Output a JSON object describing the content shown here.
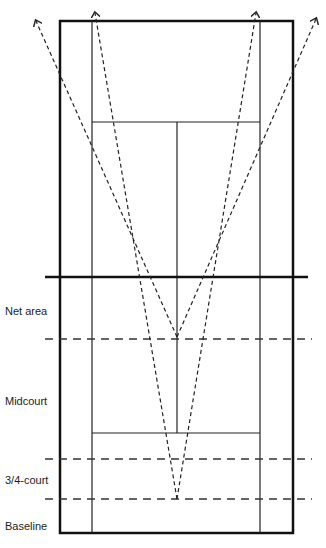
{
  "diagram": {
    "type": "tennis-court-positioning",
    "colors": {
      "lines": "#111111",
      "dashes": "#333333",
      "background": "#ffffff"
    },
    "zones": [
      {
        "label": "Net area",
        "y": 305
      },
      {
        "label": "Midcourt",
        "y": 395
      },
      {
        "label": "3/4-court",
        "y": 474
      },
      {
        "label": "Baseline",
        "y": 520
      }
    ],
    "zone_lines_y": [
      339,
      459,
      499
    ],
    "court": {
      "outer": {
        "x1": 60,
        "y1": 21,
        "x2": 293,
        "y2": 533
      },
      "singles_x": [
        92,
        260
      ],
      "service_lines_y": [
        122,
        433
      ],
      "center_x": 177,
      "net_y": 277
    },
    "arrows": [
      {
        "from": [
          177,
          337
        ],
        "to": [
          36,
          21
        ]
      },
      {
        "from": [
          177,
          337
        ],
        "to": [
          316,
          19
        ]
      },
      {
        "from": [
          177,
          499
        ],
        "to": [
          95,
          13
        ]
      },
      {
        "from": [
          177,
          499
        ],
        "to": [
          256,
          13
        ]
      }
    ]
  }
}
